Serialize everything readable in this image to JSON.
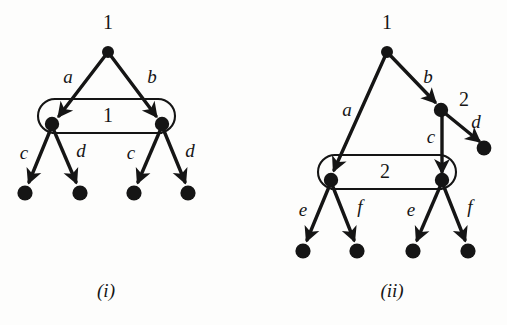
{
  "figure": {
    "background_color": "#fdfdfc",
    "ink_color": "#151515",
    "panels": [
      {
        "id": "panel-i",
        "caption": "(i)",
        "root_label": "1",
        "group_label": "1",
        "edge_labels": [
          "a",
          "b",
          "c",
          "d",
          "c",
          "d"
        ],
        "nodes": [
          {
            "name": "root",
            "x": 108,
            "y": 52,
            "r": 6.0
          },
          {
            "name": "group-left",
            "x": 52,
            "y": 124,
            "r": 7.2
          },
          {
            "name": "group-right",
            "x": 162,
            "y": 124,
            "r": 7.2
          },
          {
            "name": "leaf-1",
            "x": 25,
            "y": 193,
            "r": 7.6
          },
          {
            "name": "leaf-2",
            "x": 80,
            "y": 193,
            "r": 7.6
          },
          {
            "name": "leaf-3",
            "x": 134,
            "y": 193,
            "r": 7.6
          },
          {
            "name": "leaf-4",
            "x": 188,
            "y": 193,
            "r": 7.6
          }
        ],
        "group_box": {
          "x": 38,
          "y": 99,
          "width": 137,
          "height": 34,
          "radius": 17
        },
        "labels": [
          {
            "text": "1",
            "x": 108,
            "y": 24,
            "kind": "number"
          },
          {
            "text": "a",
            "x": 68,
            "y": 79,
            "kind": "italic"
          },
          {
            "text": "b",
            "x": 152,
            "y": 79,
            "kind": "italic"
          },
          {
            "text": "1",
            "x": 108,
            "y": 117,
            "kind": "number"
          },
          {
            "text": "c",
            "x": 24,
            "y": 155,
            "kind": "italic"
          },
          {
            "text": "d",
            "x": 81,
            "y": 153,
            "kind": "italic"
          },
          {
            "text": "c",
            "x": 131,
            "y": 155,
            "kind": "italic"
          },
          {
            "text": "d",
            "x": 190,
            "y": 153,
            "kind": "italic"
          }
        ],
        "caption_pos": {
          "x": 106,
          "y": 293
        }
      },
      {
        "id": "panel-ii",
        "caption": "(ii)",
        "root_label": "1",
        "mid_label": "2",
        "group_label": "2",
        "edge_labels": [
          "a",
          "b",
          "c",
          "d",
          "e",
          "f",
          "e",
          "f"
        ],
        "nodes": [
          {
            "name": "root",
            "x": 387,
            "y": 52,
            "r": 6.0
          },
          {
            "name": "mid-two",
            "x": 441,
            "y": 110,
            "r": 7.2
          },
          {
            "name": "leaf-d",
            "x": 484,
            "y": 148,
            "r": 7.4
          },
          {
            "name": "group-left",
            "x": 331,
            "y": 180,
            "r": 7.2
          },
          {
            "name": "group-right",
            "x": 442,
            "y": 180,
            "r": 7.2
          },
          {
            "name": "leaf-1",
            "x": 303,
            "y": 251,
            "r": 7.6
          },
          {
            "name": "leaf-2",
            "x": 357,
            "y": 251,
            "r": 7.6
          },
          {
            "name": "leaf-3",
            "x": 413,
            "y": 251,
            "r": 7.6
          },
          {
            "name": "leaf-4",
            "x": 468,
            "y": 251,
            "r": 7.6
          }
        ],
        "group_box": {
          "x": 318,
          "y": 155,
          "width": 138,
          "height": 34,
          "radius": 17
        },
        "labels": [
          {
            "text": "1",
            "x": 387,
            "y": 24,
            "kind": "number"
          },
          {
            "text": "b",
            "x": 428,
            "y": 79,
            "kind": "italic"
          },
          {
            "text": "2",
            "x": 464,
            "y": 101,
            "kind": "number"
          },
          {
            "text": "a",
            "x": 347,
            "y": 112,
            "kind": "italic"
          },
          {
            "text": "d",
            "x": 476,
            "y": 124,
            "kind": "italic"
          },
          {
            "text": "c",
            "x": 431,
            "y": 139,
            "kind": "italic"
          },
          {
            "text": "2",
            "x": 385,
            "y": 173,
            "kind": "number"
          },
          {
            "text": "e",
            "x": 303,
            "y": 212,
            "kind": "italic"
          },
          {
            "text": "f",
            "x": 360,
            "y": 209,
            "kind": "italic"
          },
          {
            "text": "e",
            "x": 411,
            "y": 212,
            "kind": "italic"
          },
          {
            "text": "f",
            "x": 470,
            "y": 209,
            "kind": "italic"
          }
        ],
        "caption_pos": {
          "x": 392,
          "y": 293
        }
      }
    ]
  }
}
